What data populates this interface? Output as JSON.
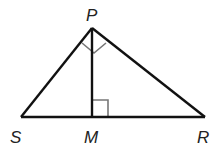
{
  "diagram": {
    "type": "geometry",
    "colors": {
      "stroke": "#111111",
      "angle_mark": "#777777",
      "label": "#222222"
    },
    "points": {
      "P": {
        "label": "P",
        "x": 92,
        "y": 28
      },
      "S": {
        "label": "S",
        "x": 21,
        "y": 117
      },
      "R": {
        "label": "R",
        "x": 205,
        "y": 117
      },
      "M": {
        "label": "M",
        "x": 92,
        "y": 117
      }
    },
    "segments": [
      "SP",
      "PR",
      "SR",
      "PM"
    ],
    "right_angles": [
      "SPR",
      "PMR"
    ]
  }
}
